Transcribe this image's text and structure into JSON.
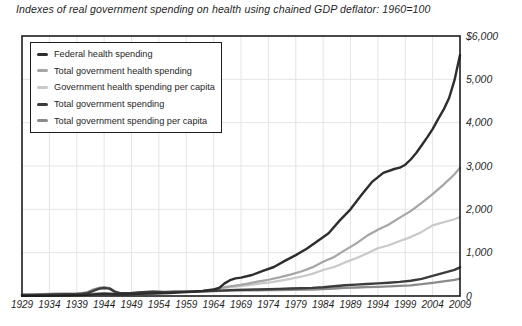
{
  "chart_data": {
    "type": "line",
    "title": "Indexes of real government spending on health using chained GDP deflator: 1960=100",
    "xlabel": "",
    "ylabel": "",
    "x_range": [
      1929,
      2009
    ],
    "y_range": [
      0,
      6000
    ],
    "grid": "on",
    "grid_color": "#e4e4e4",
    "frame_color": "#1c1c1c",
    "legend_position": "top-left-inside",
    "x_tick_years": [
      1929,
      1934,
      1939,
      1944,
      1949,
      1954,
      1959,
      1964,
      1969,
      1974,
      1979,
      1984,
      1989,
      1994,
      1999,
      2004,
      2009
    ],
    "y_ticks": [
      {
        "value": 6000,
        "label": "$6,000"
      },
      {
        "value": 5000,
        "label": "5,000"
      },
      {
        "value": 4000,
        "label": "4,000"
      },
      {
        "value": 3000,
        "label": "3,000"
      },
      {
        "value": 2000,
        "label": "2,000"
      },
      {
        "value": 1000,
        "label": "1,000"
      },
      {
        "value": 0,
        "label": "0"
      }
    ],
    "z_order": [
      "gov_health_per_capita",
      "total_gov_health",
      "total_gov_per_capita",
      "total_gov",
      "federal_health"
    ],
    "series": [
      {
        "id": "federal_health",
        "name": "Federal health spending",
        "color": "#2d2d2d",
        "width": 2.4,
        "points": [
          [
            1929,
            5
          ],
          [
            1932,
            6
          ],
          [
            1935,
            10
          ],
          [
            1938,
            16
          ],
          [
            1940,
            22
          ],
          [
            1942,
            38
          ],
          [
            1944,
            52
          ],
          [
            1946,
            42
          ],
          [
            1948,
            40
          ],
          [
            1950,
            48
          ],
          [
            1953,
            58
          ],
          [
            1956,
            70
          ],
          [
            1958,
            84
          ],
          [
            1960,
            100
          ],
          [
            1962,
            118
          ],
          [
            1964,
            150
          ],
          [
            1965,
            185
          ],
          [
            1966,
            290
          ],
          [
            1967,
            365
          ],
          [
            1968,
            405
          ],
          [
            1969,
            425
          ],
          [
            1971,
            485
          ],
          [
            1973,
            580
          ],
          [
            1975,
            670
          ],
          [
            1977,
            810
          ],
          [
            1979,
            945
          ],
          [
            1981,
            1090
          ],
          [
            1983,
            1270
          ],
          [
            1985,
            1450
          ],
          [
            1987,
            1740
          ],
          [
            1989,
            2000
          ],
          [
            1991,
            2330
          ],
          [
            1993,
            2640
          ],
          [
            1995,
            2840
          ],
          [
            1997,
            2930
          ],
          [
            1998,
            2960
          ],
          [
            1999,
            3030
          ],
          [
            2000,
            3150
          ],
          [
            2001,
            3300
          ],
          [
            2002,
            3480
          ],
          [
            2003,
            3660
          ],
          [
            2004,
            3850
          ],
          [
            2005,
            4080
          ],
          [
            2006,
            4300
          ],
          [
            2007,
            4570
          ],
          [
            2008,
            4980
          ],
          [
            2009,
            5560
          ]
        ]
      },
      {
        "id": "total_gov_health",
        "name": "Total government health spending",
        "color": "#a6a6a6",
        "width": 2.2,
        "points": [
          [
            1929,
            8
          ],
          [
            1933,
            13
          ],
          [
            1937,
            20
          ],
          [
            1940,
            30
          ],
          [
            1942,
            48
          ],
          [
            1944,
            62
          ],
          [
            1946,
            50
          ],
          [
            1949,
            56
          ],
          [
            1952,
            66
          ],
          [
            1955,
            76
          ],
          [
            1958,
            88
          ],
          [
            1960,
            100
          ],
          [
            1962,
            118
          ],
          [
            1964,
            145
          ],
          [
            1966,
            205
          ],
          [
            1968,
            240
          ],
          [
            1970,
            280
          ],
          [
            1972,
            330
          ],
          [
            1974,
            375
          ],
          [
            1976,
            430
          ],
          [
            1978,
            495
          ],
          [
            1980,
            565
          ],
          [
            1982,
            660
          ],
          [
            1984,
            790
          ],
          [
            1986,
            900
          ],
          [
            1988,
            1060
          ],
          [
            1990,
            1210
          ],
          [
            1992,
            1390
          ],
          [
            1994,
            1530
          ],
          [
            1996,
            1650
          ],
          [
            1998,
            1810
          ],
          [
            2000,
            1960
          ],
          [
            2002,
            2150
          ],
          [
            2004,
            2350
          ],
          [
            2006,
            2570
          ],
          [
            2008,
            2810
          ],
          [
            2009,
            2960
          ]
        ]
      },
      {
        "id": "gov_health_per_capita",
        "name": "Government health spending per capita",
        "color": "#c9c9c9",
        "width": 2.2,
        "points": [
          [
            1929,
            12
          ],
          [
            1933,
            18
          ],
          [
            1937,
            26
          ],
          [
            1940,
            37
          ],
          [
            1942,
            56
          ],
          [
            1944,
            70
          ],
          [
            1946,
            56
          ],
          [
            1949,
            62
          ],
          [
            1952,
            72
          ],
          [
            1955,
            82
          ],
          [
            1958,
            91
          ],
          [
            1960,
            100
          ],
          [
            1962,
            115
          ],
          [
            1964,
            137
          ],
          [
            1966,
            188
          ],
          [
            1968,
            215
          ],
          [
            1970,
            245
          ],
          [
            1972,
            280
          ],
          [
            1974,
            310
          ],
          [
            1976,
            350
          ],
          [
            1978,
            395
          ],
          [
            1980,
            445
          ],
          [
            1982,
            510
          ],
          [
            1984,
            600
          ],
          [
            1986,
            670
          ],
          [
            1988,
            775
          ],
          [
            1990,
            870
          ],
          [
            1992,
            980
          ],
          [
            1994,
            1100
          ],
          [
            1996,
            1170
          ],
          [
            1998,
            1270
          ],
          [
            2000,
            1360
          ],
          [
            2002,
            1480
          ],
          [
            2004,
            1630
          ],
          [
            2006,
            1700
          ],
          [
            2008,
            1770
          ],
          [
            2009,
            1820
          ]
        ]
      },
      {
        "id": "total_gov",
        "name": "Total government spending",
        "color": "#3c3c3c",
        "width": 2.4,
        "points": [
          [
            1929,
            22
          ],
          [
            1931,
            25
          ],
          [
            1933,
            30
          ],
          [
            1935,
            36
          ],
          [
            1937,
            39
          ],
          [
            1939,
            44
          ],
          [
            1940,
            50
          ],
          [
            1941,
            66
          ],
          [
            1942,
            115
          ],
          [
            1943,
            165
          ],
          [
            1944,
            185
          ],
          [
            1945,
            170
          ],
          [
            1946,
            95
          ],
          [
            1947,
            62
          ],
          [
            1949,
            68
          ],
          [
            1951,
            86
          ],
          [
            1953,
            96
          ],
          [
            1955,
            91
          ],
          [
            1957,
            96
          ],
          [
            1960,
            100
          ],
          [
            1962,
            110
          ],
          [
            1964,
            118
          ],
          [
            1966,
            130
          ],
          [
            1968,
            140
          ],
          [
            1970,
            145
          ],
          [
            1972,
            151
          ],
          [
            1974,
            157
          ],
          [
            1976,
            165
          ],
          [
            1978,
            172
          ],
          [
            1980,
            180
          ],
          [
            1982,
            188
          ],
          [
            1984,
            203
          ],
          [
            1986,
            226
          ],
          [
            1988,
            248
          ],
          [
            1990,
            262
          ],
          [
            1992,
            278
          ],
          [
            1994,
            291
          ],
          [
            1996,
            307
          ],
          [
            1998,
            325
          ],
          [
            2000,
            350
          ],
          [
            2002,
            395
          ],
          [
            2004,
            465
          ],
          [
            2006,
            532
          ],
          [
            2008,
            605
          ],
          [
            2009,
            662
          ]
        ]
      },
      {
        "id": "total_gov_per_capita",
        "name": "Total government spending per capita",
        "color": "#8b8b8b",
        "width": 2.3,
        "points": [
          [
            1929,
            33
          ],
          [
            1931,
            37
          ],
          [
            1933,
            44
          ],
          [
            1935,
            52
          ],
          [
            1937,
            55
          ],
          [
            1939,
            61
          ],
          [
            1940,
            68
          ],
          [
            1941,
            90
          ],
          [
            1942,
            150
          ],
          [
            1943,
            185
          ],
          [
            1944,
            198
          ],
          [
            1945,
            180
          ],
          [
            1946,
            100
          ],
          [
            1947,
            66
          ],
          [
            1949,
            72
          ],
          [
            1951,
            90
          ],
          [
            1953,
            100
          ],
          [
            1955,
            94
          ],
          [
            1957,
            98
          ],
          [
            1960,
            100
          ],
          [
            1962,
            107
          ],
          [
            1964,
            112
          ],
          [
            1966,
            120
          ],
          [
            1968,
            126
          ],
          [
            1970,
            129
          ],
          [
            1972,
            132
          ],
          [
            1974,
            134
          ],
          [
            1976,
            139
          ],
          [
            1978,
            143
          ],
          [
            1980,
            147
          ],
          [
            1982,
            151
          ],
          [
            1984,
            160
          ],
          [
            1986,
            174
          ],
          [
            1988,
            188
          ],
          [
            1990,
            196
          ],
          [
            1992,
            204
          ],
          [
            1994,
            212
          ],
          [
            1996,
            221
          ],
          [
            1998,
            233
          ],
          [
            2000,
            248
          ],
          [
            2002,
            272
          ],
          [
            2004,
            305
          ],
          [
            2006,
            338
          ],
          [
            2008,
            372
          ],
          [
            2009,
            400
          ]
        ]
      }
    ]
  }
}
